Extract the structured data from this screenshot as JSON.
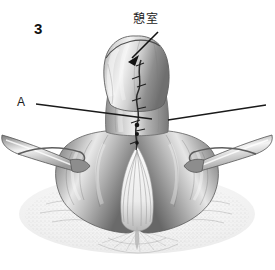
{
  "figure": {
    "number": "3",
    "type": "medical-illustration",
    "style": "grayscale pencil/stipple surgical drawing",
    "background_color": "#ffffff",
    "ink_color": "#1a1a1a"
  },
  "labels": {
    "diverticulum": {
      "text": "憩室",
      "meaning": "diverticulum",
      "x": 133,
      "y": 13,
      "leader": "arrow"
    },
    "marker_a": {
      "text": "A",
      "x": 17,
      "y": 96,
      "leader": "line"
    }
  },
  "leaders": {
    "arrow_to_diverticulum": {
      "from_x": 158,
      "from_y": 32,
      "to_x": 129,
      "to_y": 60,
      "has_arrowhead": true
    },
    "line_a_left": {
      "from_x": 36,
      "from_y": 104,
      "to_x": 152,
      "to_y": 119
    },
    "line_right": {
      "from_x": 168,
      "from_y": 120,
      "to_x": 266,
      "to_y": 105
    }
  },
  "anatomy": {
    "parts": [
      "diverticulum sac",
      "neck of diverticulum",
      "suture line",
      "cricopharyngeal muscle",
      "left retractor blade",
      "right retractor blade",
      "surrounding fascia"
    ]
  }
}
